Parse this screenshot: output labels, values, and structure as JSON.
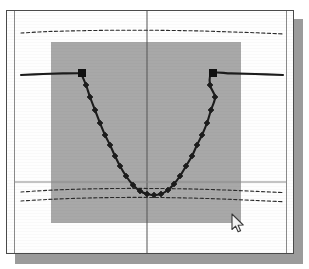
{
  "window": {
    "name": "plot-window",
    "frame_color": "#4a4a4a",
    "background_color": "#fefefe",
    "shadow_color": "#9b9b9b",
    "width": 288,
    "height": 244
  },
  "selection": {
    "name": "selection-rectangle",
    "fill_color": "#a8a8a8",
    "x": 44,
    "y": 31,
    "width": 190,
    "height": 181
  },
  "cursor": {
    "name": "mouse-pointer",
    "shape": "arrow-cursor",
    "x": 231,
    "y": 213
  },
  "chart_data": {
    "type": "line",
    "title": "",
    "subtitle": "",
    "xlabel": "",
    "ylabel": "",
    "grid": false,
    "legend": "none",
    "xlim": [
      0,
      288
    ],
    "ylim": [
      244,
      0
    ],
    "axis_lines": {
      "vertical_center": {
        "name": "vertical-crosshair",
        "x": 140,
        "color": "#555555"
      },
      "horizontal_lower": {
        "name": "horizontal-reference-line",
        "y": 171,
        "color": "#888888"
      }
    },
    "series": [
      {
        "name": "parabola-curve",
        "style": "solid",
        "color": "#1c1c1c",
        "width": 2.1,
        "marker": "diamond",
        "points": [
          [
            14,
            64
          ],
          [
            36,
            63
          ],
          [
            56,
            62.4
          ],
          [
            74,
            62.2
          ],
          [
            74,
            62.2
          ],
          [
            79,
            74
          ],
          [
            83,
            86
          ],
          [
            88,
            99
          ],
          [
            93,
            112
          ],
          [
            98,
            124
          ],
          [
            103,
            134
          ],
          [
            108,
            145
          ],
          [
            113,
            155
          ],
          [
            119,
            165
          ],
          [
            126,
            174
          ],
          [
            133,
            180
          ],
          [
            140,
            183
          ],
          [
            147,
            184
          ],
          [
            154,
            183
          ],
          [
            161,
            179
          ],
          [
            167,
            173
          ],
          [
            173,
            165
          ],
          [
            179,
            155
          ],
          [
            185,
            145
          ],
          [
            190,
            134
          ],
          [
            195,
            124
          ],
          [
            200,
            112
          ],
          [
            204,
            99
          ],
          [
            208,
            86
          ],
          [
            203,
            74
          ],
          [
            205,
            62.2
          ],
          [
            224,
            62.4
          ],
          [
            248,
            63
          ],
          [
            276,
            64
          ]
        ],
        "marker_points": [
          [
            79,
            74
          ],
          [
            83,
            86
          ],
          [
            88,
            99
          ],
          [
            93,
            112
          ],
          [
            98,
            124
          ],
          [
            103,
            134
          ],
          [
            108,
            145
          ],
          [
            113,
            155
          ],
          [
            119,
            165
          ],
          [
            126,
            174
          ],
          [
            133,
            180
          ],
          [
            140,
            183
          ],
          [
            147,
            184
          ],
          [
            154,
            183
          ],
          [
            161,
            179
          ],
          [
            167,
            173
          ],
          [
            173,
            165
          ],
          [
            179,
            155
          ],
          [
            185,
            145
          ],
          [
            190,
            134
          ],
          [
            195,
            124
          ],
          [
            200,
            112
          ],
          [
            204,
            99
          ],
          [
            208,
            86
          ],
          [
            203,
            74
          ]
        ],
        "endpoint_markers": [
          {
            "name": "left-square-handle",
            "x": 75,
            "y": 62,
            "shape": "square",
            "size": 7
          },
          {
            "name": "right-square-handle",
            "x": 206,
            "y": 62,
            "shape": "square",
            "size": 7
          }
        ]
      },
      {
        "name": "upper-dashed-envelope",
        "style": "dashed",
        "color": "#2a2a2a",
        "width": 1.1,
        "marker": "none",
        "points": [
          [
            14,
            22
          ],
          [
            40,
            20.6
          ],
          [
            70,
            19.8
          ],
          [
            100,
            19.3
          ],
          [
            130,
            19.2
          ],
          [
            160,
            19.4
          ],
          [
            190,
            19.9
          ],
          [
            220,
            20.8
          ],
          [
            250,
            21.8
          ],
          [
            276,
            22.9
          ]
        ]
      },
      {
        "name": "lower-dashed-envelope-upper",
        "style": "dashed",
        "color": "#2a2a2a",
        "width": 1.1,
        "marker": "none",
        "points": [
          [
            14,
            181
          ],
          [
            40,
            179.4
          ],
          [
            70,
            178.2
          ],
          [
            100,
            177.6
          ],
          [
            130,
            177.4
          ],
          [
            160,
            177.6
          ],
          [
            190,
            178.1
          ],
          [
            220,
            179.1
          ],
          [
            250,
            180.4
          ],
          [
            276,
            181.6
          ]
        ]
      },
      {
        "name": "lower-dashed-envelope-lower",
        "style": "dashed",
        "color": "#2a2a2a",
        "width": 1.1,
        "marker": "none",
        "points": [
          [
            14,
            190
          ],
          [
            40,
            188.5
          ],
          [
            70,
            187.3
          ],
          [
            100,
            186.6
          ],
          [
            130,
            186.4
          ],
          [
            160,
            186.6
          ],
          [
            190,
            187.2
          ],
          [
            220,
            188.2
          ],
          [
            250,
            189.5
          ],
          [
            276,
            190.7
          ]
        ]
      }
    ]
  }
}
